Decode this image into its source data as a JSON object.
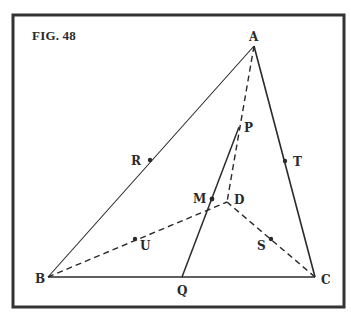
{
  "figure": {
    "title": "FIG. 48",
    "colors": {
      "ink": "#2a2a2a",
      "background": "#ffffff",
      "frame": "#333333"
    }
  },
  "points": {
    "A": {
      "label": "A",
      "x": 254,
      "y": 46
    },
    "B": {
      "label": "B",
      "x": 48,
      "y": 277
    },
    "C": {
      "label": "C",
      "x": 315,
      "y": 277
    },
    "D": {
      "label": "D",
      "x": 227,
      "y": 202
    },
    "P": {
      "label": "P",
      "x": 239,
      "y": 127
    },
    "M": {
      "label": "M",
      "x": 212,
      "y": 199
    },
    "Q": {
      "label": "Q",
      "x": 182,
      "y": 277
    },
    "R": {
      "label": "R",
      "x": 150,
      "y": 160
    },
    "T": {
      "label": "T",
      "x": 285,
      "y": 161
    },
    "U": {
      "label": "U",
      "x": 135,
      "y": 239
    },
    "S": {
      "label": "S",
      "x": 271,
      "y": 239
    }
  },
  "segments": {
    "solid": [
      "AB",
      "AC",
      "BC",
      "QP"
    ],
    "dashed": [
      "AD",
      "BD",
      "CD"
    ]
  }
}
